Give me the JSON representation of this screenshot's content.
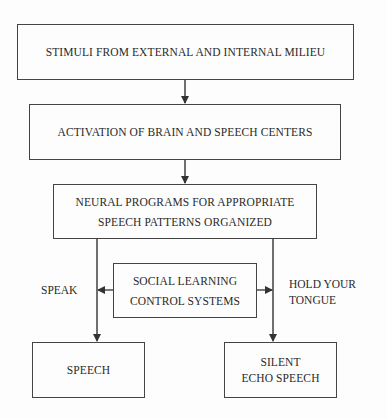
{
  "diagram": {
    "type": "flowchart",
    "nodes": {
      "stimuli": "STIMULI FROM EXTERNAL AND INTERNAL MILIEU",
      "activation": "ACTIVATION OF BRAIN AND SPEECH CENTERS",
      "neural_line1": "NEURAL PROGRAMS FOR APPROPRIATE",
      "neural_line2": "SPEECH PATTERNS ORGANIZED",
      "social_line1": "SOCIAL LEARNING",
      "social_line2": "CONTROL SYSTEMS",
      "speech": "SPEECH",
      "silent_line1": "SILENT",
      "silent_line2": "ECHO SPEECH"
    },
    "edge_labels": {
      "speak": "SPEAK",
      "hold_line1": "HOLD YOUR",
      "hold_line2": "TONGUE"
    },
    "edges": [
      {
        "from": "stimuli",
        "to": "activation"
      },
      {
        "from": "activation",
        "to": "neural"
      },
      {
        "from": "neural",
        "to": "speech",
        "label": "SPEAK"
      },
      {
        "from": "neural",
        "to": "silent",
        "label": "HOLD YOUR TONGUE"
      },
      {
        "from": "social",
        "to": "speak-branch"
      },
      {
        "from": "social",
        "to": "hold-branch"
      }
    ],
    "colors": {
      "line": "#333333",
      "background": "#fdfdfd"
    }
  }
}
